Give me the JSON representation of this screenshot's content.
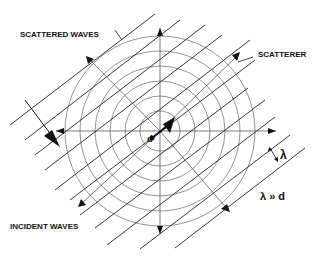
{
  "labels": {
    "scattered_waves": "SCATTERED WAVES",
    "scatterer": "SCATTERER",
    "incident_waves": "INCIDENT WAVES",
    "lambda": "λ",
    "relation": "λ » d",
    "d": "d"
  },
  "geometry": {
    "center": [
      160,
      131
    ],
    "circle_radii": [
      20,
      35,
      50,
      65,
      80,
      95
    ]
  }
}
